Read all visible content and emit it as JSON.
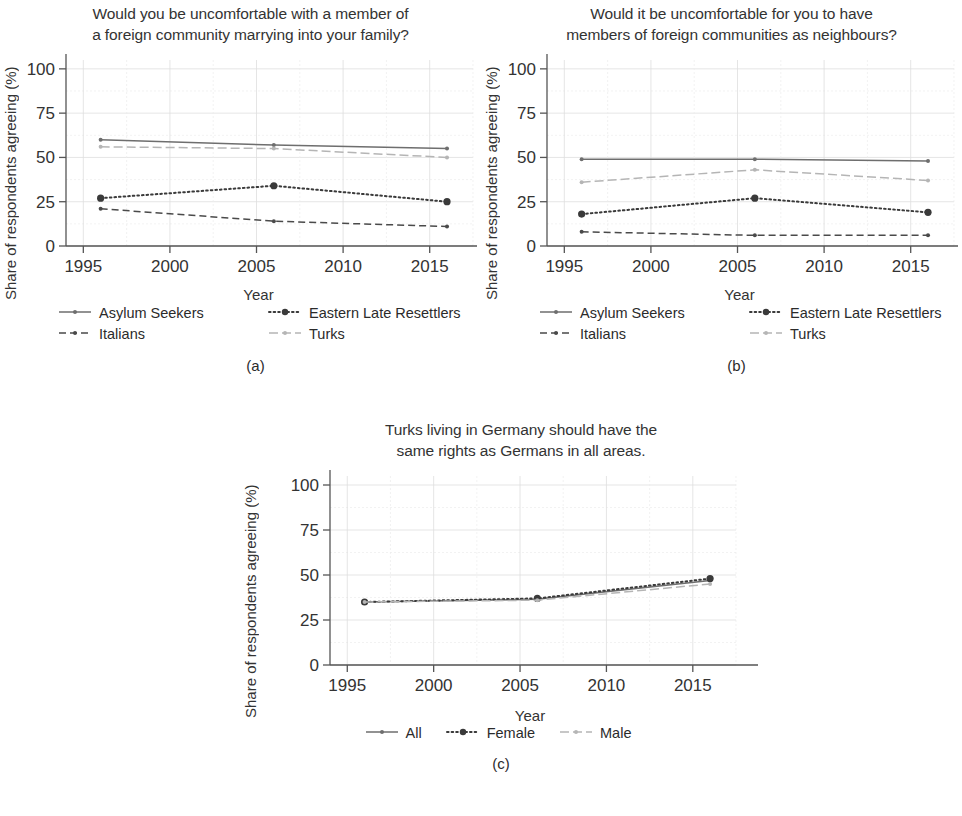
{
  "figure": {
    "ylabel": "Share of respondents agreeing (%)",
    "xlabel": "Year",
    "ytick_labels": [
      "0",
      "25",
      "50",
      "75",
      "100"
    ],
    "xtick_labels": [
      "1995",
      "2000",
      "2005",
      "2010",
      "2015"
    ]
  },
  "panels": [
    {
      "id": "a",
      "caption": "(a)",
      "title": "Would you be uncomfortable with a member of\na foreign community marrying into your family?"
    },
    {
      "id": "b",
      "caption": "(b)",
      "title": "Would it be uncomfortable for you to have\nmembers of foreign communities as neighbours?"
    },
    {
      "id": "c",
      "caption": "(c)",
      "title": "Turks living in Germany should have the\nsame rights as Germans in all areas."
    }
  ],
  "chart_data": [
    {
      "type": "line",
      "panel": "a",
      "title": "Would you be uncomfortable with a member of a foreign community marrying into your family?",
      "xlabel": "Year",
      "ylabel": "Share of respondents agreeing (%)",
      "x": [
        1996,
        2006,
        2016
      ],
      "xlim": [
        1994,
        2017.5
      ],
      "ylim": [
        0,
        105
      ],
      "xticks": [
        1995,
        2000,
        2005,
        2010,
        2015
      ],
      "yticks": [
        0,
        25,
        50,
        75,
        100
      ],
      "grid": true,
      "legend_position": "below",
      "series": [
        {
          "name": "Asylum Seekers",
          "values": [
            60,
            57,
            55
          ],
          "style": "solid",
          "marker": "small",
          "color": "#6e6e6e"
        },
        {
          "name": "Eastern Late Resettlers",
          "values": [
            27,
            34,
            25
          ],
          "style": "dotted",
          "marker": "large",
          "color": "#3a3a3a"
        },
        {
          "name": "Italians",
          "values": [
            21,
            14,
            11
          ],
          "style": "dashed",
          "marker": "small",
          "color": "#4a4a4a"
        },
        {
          "name": "Turks",
          "values": [
            56,
            55,
            50
          ],
          "style": "dashdot",
          "marker": "small",
          "color": "#b5b5b5"
        }
      ]
    },
    {
      "type": "line",
      "panel": "b",
      "title": "Would it be uncomfortable for you to have members of foreign communities as neighbours?",
      "xlabel": "Year",
      "ylabel": "Share of respondents agreeing (%)",
      "x": [
        1996,
        2006,
        2016
      ],
      "xlim": [
        1994,
        2017.5
      ],
      "ylim": [
        0,
        105
      ],
      "xticks": [
        1995,
        2000,
        2005,
        2010,
        2015
      ],
      "yticks": [
        0,
        25,
        50,
        75,
        100
      ],
      "grid": true,
      "legend_position": "below",
      "series": [
        {
          "name": "Asylum Seekers",
          "values": [
            49,
            49,
            48
          ],
          "style": "solid",
          "marker": "small",
          "color": "#6e6e6e"
        },
        {
          "name": "Eastern Late Resettlers",
          "values": [
            18,
            27,
            19
          ],
          "style": "dotted",
          "marker": "large",
          "color": "#3a3a3a"
        },
        {
          "name": "Italians",
          "values": [
            8,
            6,
            6
          ],
          "style": "dashed",
          "marker": "small",
          "color": "#4a4a4a"
        },
        {
          "name": "Turks",
          "values": [
            36,
            43,
            37
          ],
          "style": "dashdot",
          "marker": "small",
          "color": "#b5b5b5"
        }
      ]
    },
    {
      "type": "line",
      "panel": "c",
      "title": "Turks living in Germany should have the same rights as Germans in all areas.",
      "xlabel": "Year",
      "ylabel": "Share of respondents agreeing (%)",
      "x": [
        1996,
        2006,
        2016
      ],
      "xlim": [
        1994,
        2017.5
      ],
      "ylim": [
        0,
        105
      ],
      "xticks": [
        1995,
        2000,
        2005,
        2010,
        2015
      ],
      "yticks": [
        0,
        25,
        50,
        75,
        100
      ],
      "grid": true,
      "legend_position": "below",
      "series": [
        {
          "name": "All",
          "values": [
            35,
            36.5,
            47
          ],
          "style": "solid",
          "marker": "small",
          "color": "#6e6e6e"
        },
        {
          "name": "Female",
          "values": [
            35,
            37,
            48
          ],
          "style": "dotted",
          "marker": "large",
          "color": "#3a3a3a"
        },
        {
          "name": "Male",
          "values": [
            35,
            36,
            45
          ],
          "style": "dashdot",
          "marker": "small",
          "color": "#b5b5b5"
        }
      ]
    }
  ]
}
